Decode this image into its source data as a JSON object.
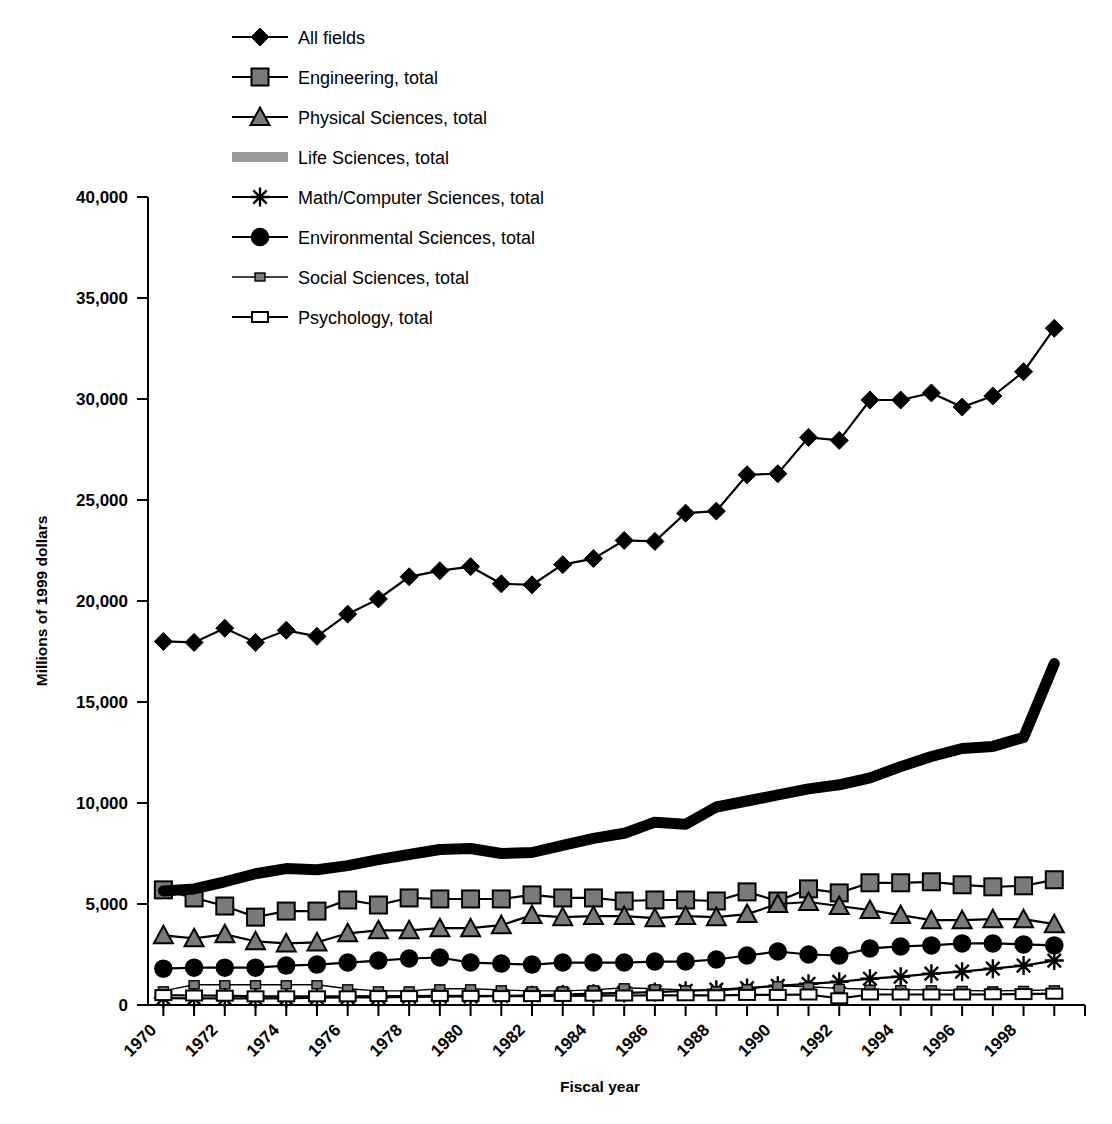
{
  "chart_data": {
    "type": "line",
    "title": "",
    "xlabel": "Fiscal year",
    "ylabel": "Millions of 1999 dollars",
    "xlim": [
      1969.5,
      2000.0
    ],
    "ylim": [
      0,
      40000
    ],
    "grid": false,
    "legend_position": "top-left",
    "y_ticks": [
      0,
      5000,
      10000,
      15000,
      20000,
      25000,
      30000,
      35000,
      40000
    ],
    "y_tick_labels": [
      "0",
      "5,000",
      "10,000",
      "15,000",
      "20,000",
      "25,000",
      "30,000",
      "35,000",
      "40,000"
    ],
    "x_tick_labels": [
      "1970",
      "1972",
      "1974",
      "1976",
      "1978",
      "1980",
      "1982",
      "1984",
      "1986",
      "1988",
      "1990",
      "1992",
      "1994",
      "1996",
      "1998"
    ],
    "x": [
      1970,
      1971,
      1972,
      1973,
      1974,
      1975,
      1976,
      1977,
      1978,
      1979,
      1980,
      1981,
      1982,
      1983,
      1984,
      1985,
      1986,
      1987,
      1988,
      1989,
      1990,
      1991,
      1992,
      1993,
      1994,
      1995,
      1996,
      1997,
      1998,
      1999
    ],
    "series": [
      {
        "name": "All fields",
        "marker": "diamond",
        "values": [
          18000,
          17950,
          18650,
          17950,
          18550,
          18250,
          19350,
          20100,
          21200,
          21500,
          21700,
          20850,
          20800,
          21800,
          22100,
          23000,
          22950,
          24350,
          24450,
          26250,
          26300,
          28100,
          27950,
          29950,
          29950,
          30300,
          29600,
          30150,
          31350,
          33500
        ]
      },
      {
        "name": "Engineering, total",
        "marker": "square",
        "values": [
          5700,
          5300,
          4900,
          4350,
          4650,
          4650,
          5200,
          4950,
          5300,
          5250,
          5250,
          5250,
          5450,
          5300,
          5300,
          5150,
          5200,
          5200,
          5150,
          5600,
          5150,
          5750,
          5550,
          6050,
          6050,
          6100,
          5950,
          5850,
          5900,
          6200
        ]
      },
      {
        "name": "Physical Sciences, total",
        "marker": "triangle",
        "values": [
          3450,
          3300,
          3500,
          3150,
          3050,
          3100,
          3550,
          3700,
          3700,
          3800,
          3800,
          3950,
          4450,
          4350,
          4400,
          4400,
          4300,
          4400,
          4350,
          4500,
          5000,
          5100,
          4900,
          4700,
          4450,
          4200,
          4200,
          4250,
          4250,
          4000
        ]
      },
      {
        "name": "Life Sciences, total",
        "marker": "band",
        "values": [
          5650,
          5750,
          6100,
          6500,
          6750,
          6700,
          6900,
          7200,
          7450,
          7700,
          7750,
          7500,
          7550,
          7900,
          8250,
          8500,
          9050,
          8950,
          9800,
          10100,
          10400,
          10700,
          10900,
          11250,
          11800,
          12300,
          12700,
          12800,
          13250,
          16900
        ]
      },
      {
        "name": "Math/Computer Sciences, total",
        "marker": "asterisk",
        "values": [
          340,
          330,
          330,
          330,
          330,
          360,
          380,
          380,
          400,
          410,
          420,
          450,
          480,
          520,
          560,
          600,
          640,
          700,
          760,
          840,
          950,
          1050,
          1150,
          1300,
          1400,
          1550,
          1650,
          1800,
          1950,
          2200
        ]
      },
      {
        "name": "Environmental Sciences, total",
        "marker": "circle",
        "values": [
          1800,
          1850,
          1850,
          1850,
          1950,
          2000,
          2100,
          2200,
          2300,
          2350,
          2100,
          2050,
          2000,
          2100,
          2100,
          2100,
          2150,
          2150,
          2250,
          2450,
          2650,
          2500,
          2450,
          2800,
          2900,
          2950,
          3050,
          3050,
          3000,
          2950
        ]
      },
      {
        "name": "Social Sciences, total",
        "marker": "small-square",
        "values": [
          700,
          1000,
          1000,
          1000,
          1000,
          1000,
          800,
          700,
          700,
          800,
          800,
          750,
          700,
          700,
          750,
          850,
          800,
          750,
          700,
          800,
          950,
          900,
          820,
          780,
          760,
          750,
          720,
          700,
          720,
          750
        ]
      },
      {
        "name": "Psychology, total",
        "marker": "open-rect",
        "values": [
          490,
          470,
          460,
          430,
          430,
          430,
          430,
          440,
          440,
          450,
          450,
          440,
          440,
          450,
          460,
          470,
          480,
          480,
          480,
          500,
          500,
          520,
          330,
          520,
          520,
          520,
          520,
          530,
          540,
          560
        ]
      }
    ]
  },
  "colors": {
    "line": "#000000",
    "marker_fill": "#7a7a7a",
    "life_band": "#9a9a9a",
    "background": "#ffffff"
  }
}
